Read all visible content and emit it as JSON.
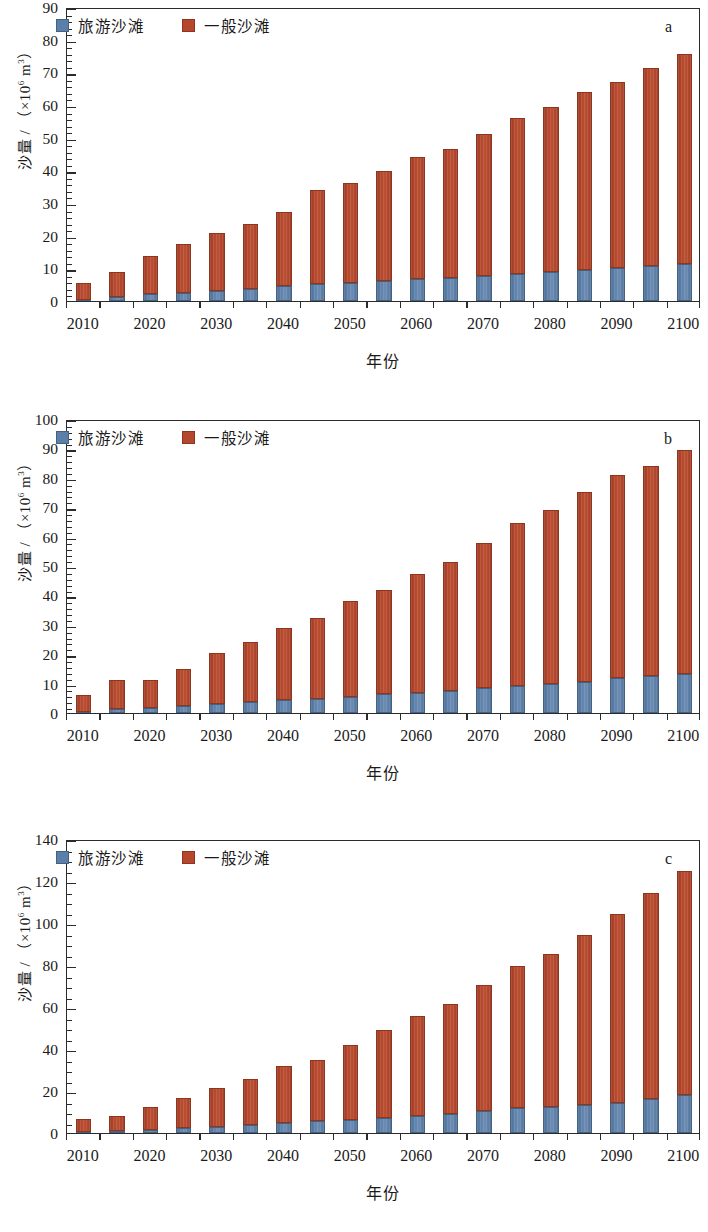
{
  "figure": {
    "background": "#ffffff",
    "axis_color": "#2b2b2b",
    "colors": {
      "tourist_beach": "#5b7fa8",
      "general_beach": "#b4472c"
    },
    "xlabel": "年份",
    "ylabel_prefix": "沙量 / （×10",
    "ylabel_exp": "6",
    "ylabel_suffix": " m",
    "ylabel_exp2": "3",
    "ylabel_close": "）",
    "legend": {
      "tourist": "旅游沙滩",
      "general": "一般沙滩"
    },
    "panel_labels": {
      "a": "a",
      "b": "b",
      "c": "c"
    },
    "xtick_labels": [
      "2010",
      "2020",
      "2030",
      "2040",
      "2050",
      "2060",
      "2070",
      "2080",
      "2090",
      "2100"
    ]
  },
  "chart_data": [
    {
      "id": "a",
      "type": "bar",
      "stacked": true,
      "title": "",
      "panel_label": "a",
      "xlabel": "年份",
      "ylabel": "沙量 / （×10⁶ m³）",
      "ylim": [
        0,
        90
      ],
      "ytick_step": 10,
      "yticks": [
        0,
        10,
        20,
        30,
        40,
        50,
        60,
        70,
        80,
        90
      ],
      "minor_tick_step": 2,
      "grid": false,
      "legend_position": "top-left",
      "categories": [
        2010,
        2015,
        2020,
        2025,
        2030,
        2035,
        2040,
        2045,
        2050,
        2055,
        2060,
        2065,
        2070,
        2075,
        2080,
        2085,
        2090,
        2095,
        2100
      ],
      "series": [
        {
          "name": "旅游沙滩",
          "color": "#5b7fa8",
          "values": [
            0.4,
            1.2,
            2.1,
            2.6,
            3.2,
            3.7,
            4.6,
            5.1,
            5.6,
            6.1,
            6.7,
            7.1,
            7.8,
            8.3,
            9.0,
            9.5,
            10.1,
            10.8,
            11.4
          ]
        },
        {
          "name": "一般沙滩",
          "color": "#b4472c",
          "values": [
            5.2,
            7.8,
            11.7,
            15.0,
            17.7,
            19.9,
            22.7,
            28.8,
            30.4,
            33.6,
            37.5,
            39.5,
            43.4,
            47.7,
            50.3,
            54.6,
            57.1,
            60.5,
            64.1
          ]
        },
        {
          "name": "合计",
          "color": "",
          "values": [
            5.6,
            9.0,
            13.8,
            17.6,
            20.9,
            23.6,
            27.3,
            33.9,
            36.0,
            39.7,
            44.2,
            46.6,
            51.2,
            56.0,
            59.3,
            64.1,
            67.2,
            71.3,
            75.5
          ]
        }
      ]
    },
    {
      "id": "b",
      "type": "bar",
      "stacked": true,
      "title": "",
      "panel_label": "b",
      "xlabel": "年份",
      "ylabel": "沙量 / （×10⁶ m³）",
      "ylim": [
        0,
        100
      ],
      "ytick_step": 10,
      "yticks": [
        0,
        10,
        20,
        30,
        40,
        50,
        60,
        70,
        80,
        90,
        100
      ],
      "minor_tick_step": 2,
      "grid": false,
      "legend_position": "top-left",
      "categories": [
        2010,
        2015,
        2020,
        2025,
        2030,
        2035,
        2040,
        2045,
        2050,
        2055,
        2060,
        2065,
        2070,
        2075,
        2080,
        2085,
        2090,
        2095,
        2100
      ],
      "series": [
        {
          "name": "旅游沙滩",
          "color": "#5b7fa8",
          "values": [
            0.5,
            1.4,
            1.6,
            2.3,
            2.9,
            3.6,
            4.3,
            4.8,
            5.6,
            6.3,
            6.9,
            7.4,
            8.5,
            9.2,
            10.0,
            10.7,
            12.0,
            12.5,
            13.4
          ]
        },
        {
          "name": "一般沙滩",
          "color": "#b4472c",
          "values": [
            5.7,
            9.9,
            9.7,
            12.6,
            17.4,
            20.4,
            24.6,
            27.4,
            32.5,
            35.6,
            40.5,
            43.8,
            49.4,
            55.3,
            59.1,
            64.6,
            68.9,
            71.5,
            76.1
          ]
        },
        {
          "name": "合计",
          "color": "",
          "values": [
            6.2,
            11.3,
            11.3,
            14.9,
            20.3,
            24.0,
            28.9,
            32.2,
            38.1,
            41.9,
            47.4,
            51.2,
            57.9,
            64.5,
            69.1,
            75.3,
            80.9,
            84.0,
            89.5
          ]
        }
      ]
    },
    {
      "id": "c",
      "type": "bar",
      "stacked": true,
      "title": "",
      "panel_label": "c",
      "xlabel": "年份",
      "ylabel": "沙量 / （×10⁶ m³）",
      "ylim": [
        0,
        140
      ],
      "ytick_step": 20,
      "yticks": [
        0,
        20,
        40,
        60,
        80,
        100,
        120,
        140
      ],
      "minor_tick_step": 5,
      "grid": false,
      "legend_position": "top-left",
      "categories": [
        2010,
        2015,
        2020,
        2025,
        2030,
        2035,
        2040,
        2045,
        2050,
        2055,
        2060,
        2065,
        2070,
        2075,
        2080,
        2085,
        2090,
        2095,
        2100
      ],
      "series": [
        {
          "name": "旅游沙滩",
          "color": "#5b7fa8",
          "values": [
            0.5,
            0.8,
            1.6,
            2.3,
            3.1,
            4.0,
            4.8,
            5.6,
            6.2,
            7.1,
            8.2,
            9.0,
            10.5,
            11.7,
            12.3,
            13.5,
            14.5,
            16.2,
            17.9
          ]
        },
        {
          "name": "一般沙滩",
          "color": "#b4472c",
          "values": [
            6.4,
            7.5,
            11.0,
            14.4,
            18.4,
            21.9,
            27.1,
            29.3,
            35.7,
            41.8,
            47.5,
            52.6,
            60.1,
            67.8,
            72.9,
            80.6,
            89.6,
            97.9,
            106.7
          ]
        },
        {
          "name": "合计",
          "color": "",
          "values": [
            6.9,
            8.3,
            12.6,
            16.7,
            21.5,
            25.9,
            31.9,
            34.9,
            41.9,
            48.9,
            55.7,
            61.6,
            70.6,
            79.5,
            85.2,
            94.1,
            104.1,
            114.1,
            124.6
          ]
        }
      ]
    }
  ]
}
